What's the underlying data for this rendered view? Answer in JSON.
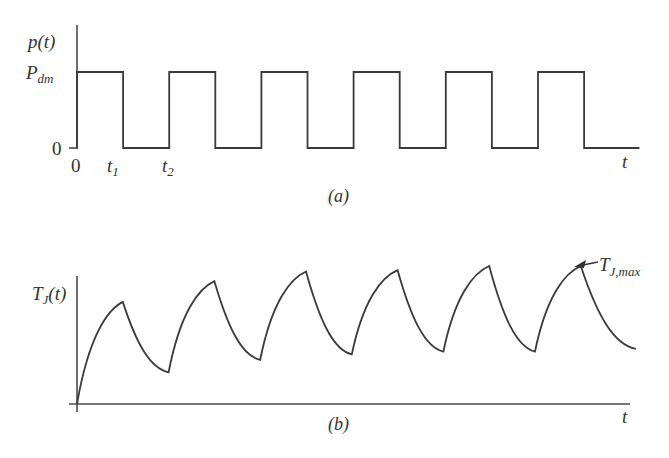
{
  "chart_data": [
    {
      "type": "line",
      "panel": "a",
      "caption": "(a)",
      "ylabel": "p(t)",
      "xlabel": "t",
      "y_ticks": [
        {
          "label": "P",
          "sub": "dm",
          "value": 1
        },
        {
          "label": "0",
          "value": 0
        }
      ],
      "x_ticks": [
        {
          "label": "0",
          "sub": "",
          "value": 0
        },
        {
          "label": "t",
          "sub": "1",
          "value": 1
        },
        {
          "label": "t",
          "sub": "2",
          "value": 2
        }
      ],
      "description": "Rectangular pulse train of amplitude P_dm; on from 0 to t1, off from t1 to t2, period t2",
      "period": 2,
      "on_duration": 1,
      "pulse_count": 6,
      "x_end": 12.2,
      "ylim": [
        0,
        1
      ]
    },
    {
      "type": "line",
      "panel": "b",
      "caption": "(b)",
      "ylabel": "T",
      "ylabel_sub": "J",
      "ylabel_suffix": "(t)",
      "xlabel": "t",
      "annotation": {
        "label": "T",
        "sub": "J,max",
        "points_to": "last peak"
      },
      "description": "Junction temperature rises exponentially during each pulse and decays between pulses, ratcheting up toward a periodic steady state",
      "points": [
        {
          "t": 0,
          "T": 0.0
        },
        {
          "t": 1,
          "T": 0.74
        },
        {
          "t": 2,
          "T": 0.23
        },
        {
          "t": 3,
          "T": 0.89
        },
        {
          "t": 4,
          "T": 0.32
        },
        {
          "t": 5,
          "T": 0.96
        },
        {
          "t": 6,
          "T": 0.36
        },
        {
          "t": 7,
          "T": 0.97
        },
        {
          "t": 8,
          "T": 0.38
        },
        {
          "t": 9,
          "T": 1.0
        },
        {
          "t": 10,
          "T": 0.38
        },
        {
          "t": 11,
          "T": 1.0
        },
        {
          "t": 12.2,
          "T": 0.4
        }
      ],
      "ylim": [
        0,
        1
      ]
    }
  ]
}
